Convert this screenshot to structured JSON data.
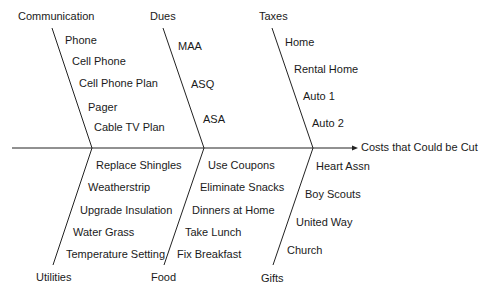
{
  "effect": "Costs that Could be Cut",
  "categories": {
    "communication": {
      "label": "Communication",
      "causes": [
        "Phone",
        "Cell Phone",
        "Cell Phone Plan",
        "Pager",
        "Cable TV Plan"
      ]
    },
    "dues": {
      "label": "Dues",
      "causes": [
        "MAA",
        "ASQ",
        "ASA"
      ]
    },
    "taxes": {
      "label": "Taxes",
      "causes": [
        "Home",
        "Rental Home",
        "Auto 1",
        "Auto 2"
      ]
    },
    "utilities": {
      "label": "Utilities",
      "causes": [
        "Replace Shingles",
        "Weatherstrip",
        "Upgrade Insulation",
        "Water Grass",
        "Temperature Setting"
      ]
    },
    "food": {
      "label": "Food",
      "causes": [
        "Use Coupons",
        "Eliminate Snacks",
        "Dinners at Home",
        "Take Lunch",
        "Fix Breakfast"
      ]
    },
    "gifts": {
      "label": "Gifts",
      "causes": [
        "Heart Assn",
        "Boy Scouts",
        "United Way",
        "Church"
      ]
    }
  },
  "colors": {
    "line": "#1a1a1a",
    "text": "#1a1a1a",
    "background": "#ffffff"
  }
}
